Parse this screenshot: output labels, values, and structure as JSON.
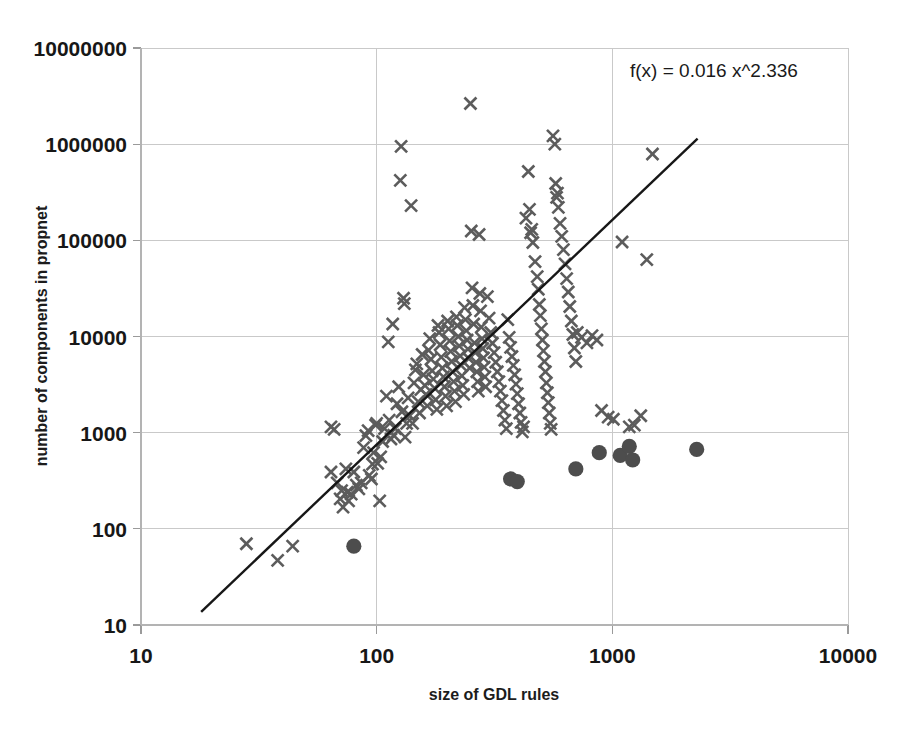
{
  "chart_data": {
    "type": "scatter",
    "title": "",
    "xlabel": "size of GDL rules",
    "ylabel": "number of components in propnet",
    "xscale": "log",
    "yscale": "log",
    "xlim": [
      10,
      10000
    ],
    "ylim": [
      10,
      10000000
    ],
    "xticks": [
      "10",
      "100",
      "1000",
      "10000"
    ],
    "yticks": [
      "10",
      "100",
      "1000",
      "10000",
      "100000",
      "1000000",
      "10000000"
    ],
    "grid": true,
    "legend": "none",
    "annotation": "f(x) = 0.016 x^2.336",
    "trendline": {
      "label": "f(x) = 0.016 x^2.336",
      "coefficient": 0.016,
      "exponent": 2.336,
      "x_start": 18,
      "x_end": 2300,
      "color": "#171717"
    },
    "series": [
      {
        "name": "propnet components (x marker)",
        "marker": "x",
        "color": "#5c5c5c",
        "points": [
          [
            28,
            70
          ],
          [
            38,
            47
          ],
          [
            44,
            66
          ],
          [
            64,
            390
          ],
          [
            64,
            1150
          ],
          [
            66,
            1080
          ],
          [
            68,
            300
          ],
          [
            70,
            205
          ],
          [
            71,
            250
          ],
          [
            72,
            168
          ],
          [
            74,
            420
          ],
          [
            75,
            240
          ],
          [
            76,
            195
          ],
          [
            78,
            230
          ],
          [
            80,
            390
          ],
          [
            82,
            285
          ],
          [
            84,
            260
          ],
          [
            86,
            300
          ],
          [
            88,
            700
          ],
          [
            90,
            930
          ],
          [
            92,
            1050
          ],
          [
            93,
            360
          ],
          [
            95,
            330
          ],
          [
            96,
            470
          ],
          [
            97,
            620
          ],
          [
            99,
            1200
          ],
          [
            100,
            1250
          ],
          [
            101,
            480
          ],
          [
            103,
            195
          ],
          [
            104,
            560
          ],
          [
            106,
            810
          ],
          [
            108,
            1100
          ],
          [
            110,
            2400
          ],
          [
            112,
            8800
          ],
          [
            113,
            1350
          ],
          [
            115,
            860
          ],
          [
            117,
            13500
          ],
          [
            118,
            940
          ],
          [
            120,
            1100
          ],
          [
            122,
            2000
          ],
          [
            124,
            3000
          ],
          [
            126,
            420000
          ],
          [
            127,
            950000
          ],
          [
            128,
            1650
          ],
          [
            130,
            25000
          ],
          [
            131,
            22000
          ],
          [
            132,
            900
          ],
          [
            134,
            1250
          ],
          [
            136,
            2300
          ],
          [
            138,
            1500
          ],
          [
            140,
            230000
          ],
          [
            142,
            1250
          ],
          [
            144,
            3300
          ],
          [
            146,
            4500
          ],
          [
            148,
            5200
          ],
          [
            150,
            2100
          ],
          [
            152,
            1600
          ],
          [
            154,
            2800
          ],
          [
            156,
            6500
          ],
          [
            158,
            4000
          ],
          [
            160,
            3100
          ],
          [
            162,
            2500
          ],
          [
            164,
            1900
          ],
          [
            166,
            7200
          ],
          [
            168,
            9500
          ],
          [
            170,
            5800
          ],
          [
            172,
            4400
          ],
          [
            174,
            3600
          ],
          [
            176,
            2900
          ],
          [
            178,
            2200
          ],
          [
            180,
            1750
          ],
          [
            182,
            13000
          ],
          [
            184,
            11000
          ],
          [
            186,
            8200
          ],
          [
            188,
            6100
          ],
          [
            190,
            4700
          ],
          [
            192,
            3800
          ],
          [
            194,
            3000
          ],
          [
            196,
            2400
          ],
          [
            198,
            1900
          ],
          [
            200,
            14500
          ],
          [
            202,
            12000
          ],
          [
            204,
            9000
          ],
          [
            206,
            7000
          ],
          [
            208,
            5500
          ],
          [
            210,
            4300
          ],
          [
            212,
            3400
          ],
          [
            214,
            2700
          ],
          [
            216,
            2100
          ],
          [
            218,
            16000
          ],
          [
            220,
            13000
          ],
          [
            222,
            10000
          ],
          [
            224,
            8000
          ],
          [
            226,
            6300
          ],
          [
            228,
            5000
          ],
          [
            230,
            3900
          ],
          [
            232,
            3100
          ],
          [
            234,
            2500
          ],
          [
            236,
            20000
          ],
          [
            238,
            15000
          ],
          [
            240,
            11500
          ],
          [
            242,
            9200
          ],
          [
            244,
            7400
          ],
          [
            246,
            5900
          ],
          [
            248,
            4700
          ],
          [
            250,
            2650000
          ],
          [
            252,
            125000
          ],
          [
            254,
            32000
          ],
          [
            256,
            21000
          ],
          [
            258,
            13500
          ],
          [
            260,
            8600
          ],
          [
            262,
            6800
          ],
          [
            264,
            5400
          ],
          [
            266,
            4300
          ],
          [
            268,
            3400
          ],
          [
            270,
            2700
          ],
          [
            272,
            115000
          ],
          [
            274,
            28000
          ],
          [
            276,
            18500
          ],
          [
            278,
            12500
          ],
          [
            280,
            9500
          ],
          [
            282,
            7500
          ],
          [
            284,
            6000
          ],
          [
            286,
            4800
          ],
          [
            288,
            3800
          ],
          [
            290,
            3000
          ],
          [
            295,
            26000
          ],
          [
            300,
            15500
          ],
          [
            305,
            11000
          ],
          [
            310,
            8500
          ],
          [
            315,
            6800
          ],
          [
            320,
            5400
          ],
          [
            325,
            4300
          ],
          [
            330,
            3400
          ],
          [
            335,
            2700
          ],
          [
            340,
            2150
          ],
          [
            345,
            1700
          ],
          [
            350,
            1350
          ],
          [
            355,
            1100
          ],
          [
            360,
            15000
          ],
          [
            365,
            9800
          ],
          [
            370,
            7700
          ],
          [
            375,
            6200
          ],
          [
            380,
            5000
          ],
          [
            385,
            4000
          ],
          [
            390,
            3200
          ],
          [
            395,
            2550
          ],
          [
            400,
            2000
          ],
          [
            405,
            1600
          ],
          [
            410,
            1280
          ],
          [
            415,
            1020
          ],
          [
            420,
            1150
          ],
          [
            430,
            170000
          ],
          [
            440,
            520000
          ],
          [
            445,
            210000
          ],
          [
            450,
            120000
          ],
          [
            455,
            130000
          ],
          [
            460,
            95000
          ],
          [
            470,
            60000
          ],
          [
            480,
            42000
          ],
          [
            485,
            31000
          ],
          [
            490,
            21500
          ],
          [
            495,
            16500
          ],
          [
            500,
            12000
          ],
          [
            505,
            9200
          ],
          [
            510,
            7100
          ],
          [
            515,
            5500
          ],
          [
            520,
            4300
          ],
          [
            525,
            3300
          ],
          [
            530,
            2600
          ],
          [
            535,
            2050
          ],
          [
            540,
            1600
          ],
          [
            545,
            1250
          ],
          [
            550,
            1080
          ],
          [
            560,
            1220000
          ],
          [
            570,
            1000000
          ],
          [
            575,
            390000
          ],
          [
            580,
            280000
          ],
          [
            585,
            310000
          ],
          [
            590,
            220000
          ],
          [
            600,
            150000
          ],
          [
            610,
            110000
          ],
          [
            620,
            80000
          ],
          [
            630,
            57000
          ],
          [
            640,
            40000
          ],
          [
            650,
            29000
          ],
          [
            660,
            20500
          ],
          [
            670,
            14500
          ],
          [
            680,
            10500
          ],
          [
            690,
            7600
          ],
          [
            700,
            5500
          ],
          [
            710,
            11000
          ],
          [
            740,
            9800
          ],
          [
            780,
            8600
          ],
          [
            820,
            10200
          ],
          [
            860,
            9200
          ],
          [
            900,
            1700
          ],
          [
            960,
            1450
          ],
          [
            1010,
            1380
          ],
          [
            1100,
            96000
          ],
          [
            1180,
            1150
          ],
          [
            1240,
            1200
          ],
          [
            1320,
            1500
          ],
          [
            1400,
            63000
          ],
          [
            1480,
            790000
          ]
        ]
      },
      {
        "name": "unsolved / timeout instances (filled circle)",
        "marker": "circle",
        "color": "#4d4d4d",
        "points": [
          [
            80,
            66
          ],
          [
            370,
            330
          ],
          [
            395,
            310
          ],
          [
            700,
            420
          ],
          [
            880,
            620
          ],
          [
            1080,
            580
          ],
          [
            1180,
            720
          ],
          [
            1220,
            520
          ],
          [
            2280,
            670
          ]
        ]
      }
    ]
  },
  "geometry": {
    "plot_left": 141,
    "plot_right": 848,
    "plot_top": 48,
    "plot_bottom": 625
  },
  "labels": {
    "equation": "f(x) = 0.016 x^2.336",
    "x_axis_title": "size of GDL rules",
    "y_axis_title": "number of components in propnet"
  }
}
